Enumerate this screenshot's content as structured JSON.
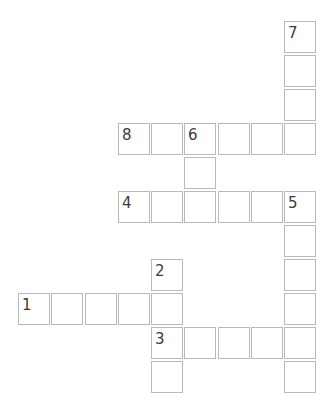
{
  "puzzle": {
    "type": "crossword",
    "grid": {
      "origin_x": 18,
      "origin_y": 21,
      "pitch_x": 33.25,
      "pitch_y": 34,
      "cell_size": 32
    },
    "cells": [
      {
        "row": 0,
        "col": 8,
        "number": "7"
      },
      {
        "row": 1,
        "col": 8,
        "number": ""
      },
      {
        "row": 2,
        "col": 8,
        "number": ""
      },
      {
        "row": 3,
        "col": 3,
        "number": "8"
      },
      {
        "row": 3,
        "col": 4,
        "number": ""
      },
      {
        "row": 3,
        "col": 5,
        "number": "6"
      },
      {
        "row": 3,
        "col": 6,
        "number": ""
      },
      {
        "row": 3,
        "col": 7,
        "number": ""
      },
      {
        "row": 3,
        "col": 8,
        "number": ""
      },
      {
        "row": 4,
        "col": 5,
        "number": ""
      },
      {
        "row": 5,
        "col": 3,
        "number": "4"
      },
      {
        "row": 5,
        "col": 4,
        "number": ""
      },
      {
        "row": 5,
        "col": 5,
        "number": ""
      },
      {
        "row": 5,
        "col": 6,
        "number": ""
      },
      {
        "row": 5,
        "col": 7,
        "number": ""
      },
      {
        "row": 5,
        "col": 8,
        "number": "5"
      },
      {
        "row": 6,
        "col": 8,
        "number": ""
      },
      {
        "row": 7,
        "col": 4,
        "number": "2"
      },
      {
        "row": 7,
        "col": 8,
        "number": ""
      },
      {
        "row": 8,
        "col": 0,
        "number": "1"
      },
      {
        "row": 8,
        "col": 1,
        "number": ""
      },
      {
        "row": 8,
        "col": 2,
        "number": ""
      },
      {
        "row": 8,
        "col": 3,
        "number": ""
      },
      {
        "row": 8,
        "col": 4,
        "number": ""
      },
      {
        "row": 8,
        "col": 8,
        "number": ""
      },
      {
        "row": 9,
        "col": 4,
        "number": "3"
      },
      {
        "row": 9,
        "col": 5,
        "number": ""
      },
      {
        "row": 9,
        "col": 6,
        "number": ""
      },
      {
        "row": 9,
        "col": 7,
        "number": ""
      },
      {
        "row": 9,
        "col": 8,
        "number": ""
      },
      {
        "row": 10,
        "col": 4,
        "number": ""
      },
      {
        "row": 10,
        "col": 8,
        "number": ""
      }
    ]
  }
}
